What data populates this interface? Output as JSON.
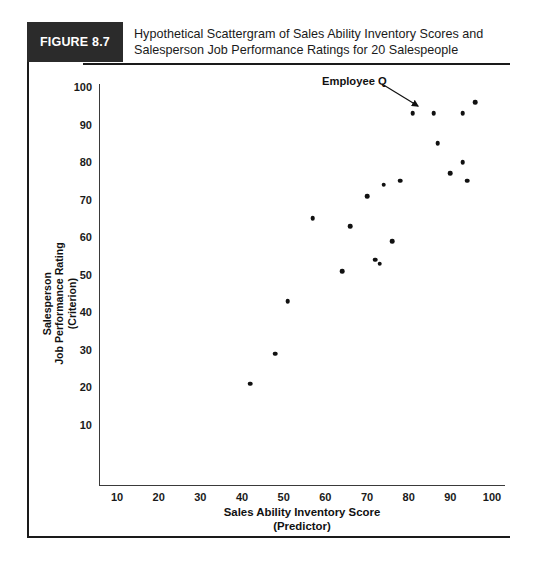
{
  "figure": {
    "number_label": "FIGURE 8.7",
    "caption_line1": "Hypothetical Scattergram of Sales Ability Inventory Scores and",
    "caption_line2": "Salesperson Job Performance Ratings for 20 Salespeople",
    "box_color": "#2b2b2b",
    "rule_color": "#1a1a1a"
  },
  "annotation": {
    "label": "Employee Q",
    "points_to": {
      "x": 81,
      "y": 93
    }
  },
  "chart_data": {
    "type": "scatter",
    "title": "Hypothetical Scattergram of Sales Ability Inventory Scores and Salesperson Job Performance Ratings for 20 Salespeople",
    "xlabel": "Sales Ability Inventory Score",
    "xlabel_sub": "(Predictor)",
    "ylabel": "Salesperson Job Performance Rating",
    "ylabel_sub": "(Criterion)",
    "ylabel_line1": "Salesperson",
    "ylabel_line2": "Job Performance Rating",
    "ylabel_line3": "(Criterion)",
    "xlim": [
      0,
      100
    ],
    "ylim": [
      0,
      100
    ],
    "xticks": [
      10,
      20,
      30,
      40,
      50,
      60,
      70,
      80,
      90,
      100
    ],
    "yticks": [
      10,
      20,
      30,
      40,
      50,
      60,
      70,
      80,
      90,
      100
    ],
    "grid": false,
    "legend": false,
    "n_points": 20,
    "marker_color": "#111111",
    "points": [
      {
        "x": 42,
        "y": 21
      },
      {
        "x": 48,
        "y": 29
      },
      {
        "x": 51,
        "y": 43
      },
      {
        "x": 57,
        "y": 65
      },
      {
        "x": 64,
        "y": 51
      },
      {
        "x": 66,
        "y": 63
      },
      {
        "x": 70,
        "y": 71
      },
      {
        "x": 72,
        "y": 54
      },
      {
        "x": 73,
        "y": 53
      },
      {
        "x": 74,
        "y": 74
      },
      {
        "x": 76,
        "y": 59
      },
      {
        "x": 78,
        "y": 75
      },
      {
        "x": 81,
        "y": 93
      },
      {
        "x": 86,
        "y": 93
      },
      {
        "x": 87,
        "y": 85
      },
      {
        "x": 90,
        "y": 77
      },
      {
        "x": 93,
        "y": 80
      },
      {
        "x": 93,
        "y": 93
      },
      {
        "x": 94,
        "y": 75
      },
      {
        "x": 96,
        "y": 96
      }
    ]
  }
}
